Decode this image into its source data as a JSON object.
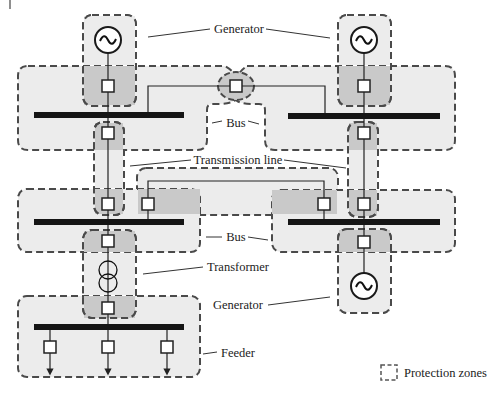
{
  "diagram": {
    "labels": {
      "generator_top": "Generator",
      "bus_top": "Bus",
      "transmission_line": "Transmission line",
      "bus_bottom": "Bus",
      "transformer": "Transformer",
      "generator_bottom": "Generator",
      "feeder": "Feeder"
    },
    "legend": {
      "protection_zones": "Protection zones"
    },
    "components": {
      "generators": 3,
      "buses": 5,
      "transformers": 1,
      "feeder_outputs": 3,
      "circuit_breakers": 15
    },
    "colors": {
      "zone_fill": "#ececec",
      "zone_overlap_fill": "#c9c9c9",
      "zone_border": "#4a4a4a",
      "bus_bar": "#151515"
    }
  }
}
